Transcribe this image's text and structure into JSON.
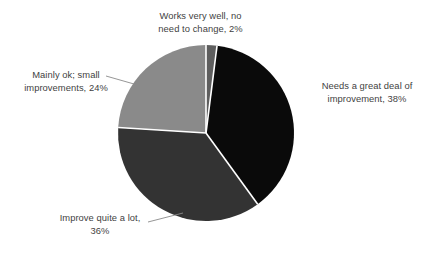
{
  "chart_data": {
    "type": "pie",
    "title": "",
    "categories": [
      "Works very well, no need to change",
      "Needs a great deal of improvement",
      "Improve quite a lot",
      "Mainly ok; small improvements"
    ],
    "values": [
      2,
      38,
      36,
      24
    ],
    "unit": "%",
    "legend": "none",
    "grid": false,
    "colors": [
      "#5e5e5e",
      "#0a0a0a",
      "#333333",
      "#8a8a8a"
    ],
    "slice_separator_color": "#ffffff",
    "start_angle_deg": 0,
    "direction": "clockwise"
  },
  "labels": {
    "works_very_well": "Works very well, no\nneed to change, 2%",
    "needs_great_deal": "Needs a great deal of\nimprovement, 38%",
    "improve_quite_a_lot": "Improve quite a lot,\n36%",
    "mainly_ok": "Mainly ok; small\nimprovements, 24%"
  },
  "style": {
    "background": "#ffffff",
    "text_color": "#3f3f3f",
    "leader_line_color": "#8a8a8a"
  }
}
